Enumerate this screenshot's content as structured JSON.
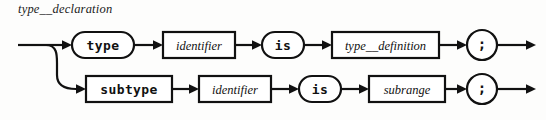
{
  "diagram": {
    "kind": "railroad-syntax-diagram",
    "title": "type__declaration",
    "colors": {
      "ink": "#111111",
      "paper": "#fdfdfc",
      "node_fill": "#ffffff"
    },
    "rows": [
      {
        "id": "type-branch",
        "y": 45,
        "nodes": [
          {
            "id": "kw-type",
            "label": "type",
            "shape": "stadium",
            "style": "terminal",
            "x": 72,
            "w": 62,
            "h": 26
          },
          {
            "id": "nt-identifier-1",
            "label": "identifier",
            "shape": "rectangle",
            "style": "nonterminal",
            "x": 163,
            "w": 72,
            "h": 26
          },
          {
            "id": "kw-is-1",
            "label": "is",
            "shape": "stadium",
            "style": "terminal",
            "x": 262,
            "w": 42,
            "h": 26
          },
          {
            "id": "nt-type-definition",
            "label": "type__definition",
            "shape": "rectangle",
            "style": "nonterminal",
            "x": 332,
            "w": 107,
            "h": 26
          },
          {
            "id": "punct-semicolon-1",
            "label": ";",
            "shape": "circle",
            "style": "punctuation",
            "x": 467,
            "w": 30,
            "h": 30
          }
        ]
      },
      {
        "id": "subtype-branch",
        "y": 89,
        "nodes": [
          {
            "id": "kw-subtype",
            "label": "subtype",
            "shape": "rectangle",
            "style": "terminal",
            "x": 85,
            "w": 86,
            "h": 26
          },
          {
            "id": "nt-identifier-2",
            "label": "identifier",
            "shape": "rectangle",
            "style": "nonterminal",
            "x": 199,
            "w": 72,
            "h": 26
          },
          {
            "id": "kw-is-2",
            "label": "is",
            "shape": "stadium",
            "style": "terminal",
            "x": 299,
            "w": 42,
            "h": 26
          },
          {
            "id": "nt-subrange",
            "label": "subrange",
            "shape": "rectangle",
            "style": "nonterminal",
            "x": 369,
            "w": 76,
            "h": 26
          },
          {
            "id": "punct-semicolon-2",
            "label": ";",
            "shape": "circle",
            "style": "punctuation",
            "x": 467,
            "w": 30,
            "h": 30
          }
        ]
      }
    ],
    "entry": {
      "x": 18,
      "y": 45
    },
    "fork": {
      "x": 46,
      "from_y": 45,
      "to_y": 89
    },
    "exits": [
      {
        "id": "exit-top",
        "x_start": 497,
        "x_end": 536,
        "y": 45
      },
      {
        "id": "exit-bottom",
        "x_start": 497,
        "x_end": 536,
        "y": 89
      }
    ]
  }
}
